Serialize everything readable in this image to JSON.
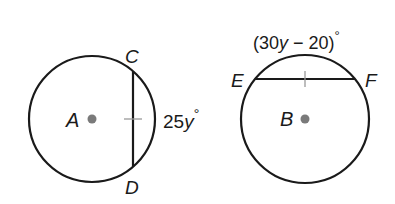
{
  "diagram": {
    "type": "geometry",
    "figures": [
      {
        "circle_label": "A",
        "chord_endpoints": [
          "C",
          "D"
        ],
        "arc_measure": "25y°",
        "arc_measure_parts": {
          "coef": "25",
          "var": "y",
          "deg": "°"
        },
        "tick_mark": true
      },
      {
        "circle_label": "B",
        "chord_endpoints": [
          "E",
          "F"
        ],
        "arc_measure": "(30y − 20)°",
        "arc_measure_parts": {
          "open": "(30",
          "var": "y",
          "rest": " − 20)",
          "deg": "°"
        },
        "tick_mark": true
      }
    ],
    "colors": {
      "stroke": "#1a1a1a",
      "center_dot": "#7a7a7a",
      "tick": "#9a9a9a"
    }
  }
}
